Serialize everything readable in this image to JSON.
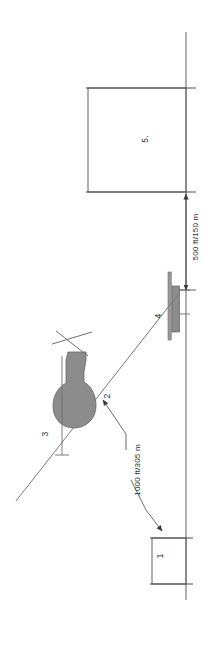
{
  "diagram": {
    "orientation_note": "rotated 90 degrees",
    "colors": {
      "line": "#6e6e6e",
      "dark_line": "#4a4a4a",
      "fill_gray": "#8c8c8c",
      "text": "#2b2b2b",
      "background": "#ffffff"
    },
    "callouts": [
      {
        "id": "1",
        "label": "1",
        "name": "building-callout"
      },
      {
        "id": "2",
        "label": "2",
        "name": "line-of-sight-callout"
      },
      {
        "id": "3",
        "label": "3",
        "name": "tower-callout"
      },
      {
        "id": "4",
        "label": "4",
        "name": "antenna-mast-callout"
      },
      {
        "id": "5",
        "label": "5.",
        "name": "area-callout"
      }
    ],
    "dimensions": [
      {
        "id": "d1000",
        "label": "1000 ft/305 m",
        "name": "distance-1000ft"
      },
      {
        "id": "d500",
        "label": "500 ft/150 m",
        "name": "distance-500ft"
      }
    ]
  }
}
